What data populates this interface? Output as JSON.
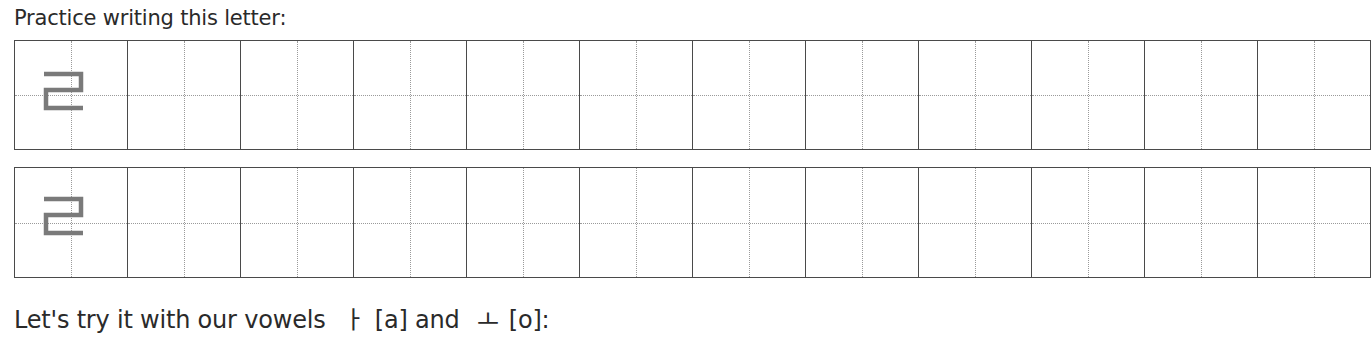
{
  "heading": "Practice writing this letter:",
  "practice_letter": "ㄹ",
  "letter_color": "#7a7a7a",
  "grid": {
    "rows": 2,
    "cells_per_row": 12,
    "model_cell_index": 0
  },
  "footer": {
    "prefix": "Let's try it with our vowels",
    "vowel1": "ㅏ",
    "vowel1_roman": "[a]",
    "conj": "and",
    "vowel2": "ㅗ",
    "vowel2_roman": "[o]:"
  }
}
